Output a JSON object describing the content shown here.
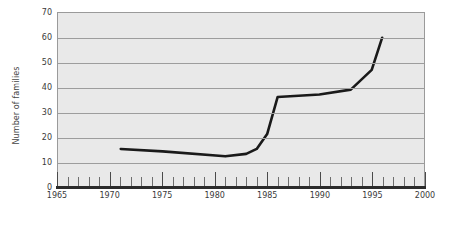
{
  "chart_data": {
    "type": "line",
    "title": "",
    "xlabel": "",
    "ylabel": "Number of families",
    "xlim": [
      1965,
      2000
    ],
    "ylim": [
      0,
      70
    ],
    "grid": true,
    "legend": "none",
    "x_ticks": [
      1965,
      1970,
      1975,
      1980,
      1985,
      1990,
      1995,
      2000
    ],
    "x_tick_labels": [
      "1965",
      "1970",
      "1975",
      "1980",
      "1985",
      "1990",
      "1995",
      "2000"
    ],
    "x_minor_tick_step": 1,
    "y_ticks": [
      0,
      10,
      20,
      30,
      40,
      50,
      60,
      70
    ],
    "y_tick_labels": [
      "0",
      "10",
      "20",
      "30",
      "40",
      "50",
      "60",
      "70"
    ],
    "series": [
      {
        "name": "Number of families",
        "color": "#1a1a1a",
        "line_width": 2.6,
        "x": [
          1971,
          1975,
          1981,
          1983,
          1984,
          1985,
          1986,
          1990,
          1993,
          1995,
          1996
        ],
        "values": [
          15,
          14,
          12,
          13,
          15,
          21,
          36,
          37,
          39,
          47,
          60
        ]
      }
    ]
  },
  "axis": {
    "y_title": "Number of families"
  }
}
